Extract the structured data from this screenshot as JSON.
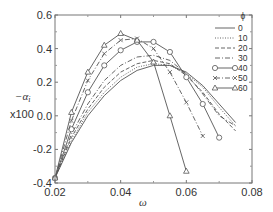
{
  "chart_data": {
    "type": "line",
    "title": "",
    "xlabel": "ω",
    "ylabel": "-α_i",
    "ylabel_scale": "x100",
    "xlim": [
      0.02,
      0.08
    ],
    "ylim": [
      -0.4,
      0.6
    ],
    "xticks": [
      "0.02",
      "0.04",
      "0.06",
      "0.08"
    ],
    "yticks": [
      "-0.4",
      "-0.2",
      "0.0",
      "0.2",
      "0.4",
      "0.6"
    ],
    "grid": false,
    "legend_title": "ϕ",
    "legend_position": "upper right",
    "series": [
      {
        "name": "0",
        "style": "solid",
        "marker": "none",
        "x": [
          0.02,
          0.025,
          0.03,
          0.035,
          0.04,
          0.045,
          0.05,
          0.055,
          0.06,
          0.065,
          0.07,
          0.075
        ],
        "y": [
          -0.37,
          -0.16,
          0.0,
          0.12,
          0.21,
          0.27,
          0.3,
          0.3,
          0.26,
          0.18,
          0.07,
          -0.04
        ]
      },
      {
        "name": "10",
        "style": "dotted",
        "marker": "none",
        "x": [
          0.02,
          0.025,
          0.03,
          0.035,
          0.04,
          0.045,
          0.05,
          0.055,
          0.06,
          0.065,
          0.07,
          0.075
        ],
        "y": [
          -0.37,
          -0.15,
          0.02,
          0.14,
          0.23,
          0.29,
          0.31,
          0.3,
          0.25,
          0.17,
          0.05,
          -0.06
        ]
      },
      {
        "name": "20",
        "style": "dashed",
        "marker": "none",
        "x": [
          0.02,
          0.025,
          0.03,
          0.035,
          0.04,
          0.045,
          0.05,
          0.055,
          0.06,
          0.065,
          0.07,
          0.075
        ],
        "y": [
          -0.37,
          -0.13,
          0.04,
          0.17,
          0.26,
          0.31,
          0.33,
          0.31,
          0.24,
          0.14,
          0.01,
          -0.09
        ]
      },
      {
        "name": "30",
        "style": "dashdot",
        "marker": "none",
        "x": [
          0.02,
          0.025,
          0.03,
          0.035,
          0.04,
          0.045,
          0.05,
          0.055,
          0.06,
          0.065,
          0.07,
          0.075
        ],
        "y": [
          -0.37,
          -0.11,
          0.07,
          0.21,
          0.3,
          0.35,
          0.36,
          0.33,
          0.25,
          0.13,
          0.0,
          -0.06
        ]
      },
      {
        "name": "40",
        "style": "solid",
        "marker": "circle",
        "x": [
          0.02,
          0.025,
          0.03,
          0.035,
          0.04,
          0.045,
          0.05,
          0.055,
          0.06,
          0.065,
          0.07
        ],
        "y": [
          -0.37,
          -0.08,
          0.14,
          0.3,
          0.39,
          0.44,
          0.44,
          0.38,
          0.23,
          0.07,
          -0.13
        ]
      },
      {
        "name": "50",
        "style": "dashdot",
        "marker": "x",
        "x": [
          0.02,
          0.025,
          0.03,
          0.035,
          0.04,
          0.045,
          0.05,
          0.055,
          0.06,
          0.065
        ],
        "y": [
          -0.37,
          -0.03,
          0.21,
          0.37,
          0.45,
          0.46,
          0.4,
          0.26,
          0.08,
          -0.12
        ]
      },
      {
        "name": "60",
        "style": "solid",
        "marker": "triangle",
        "x": [
          0.02,
          0.025,
          0.03,
          0.035,
          0.04,
          0.045,
          0.05,
          0.055,
          0.06
        ],
        "y": [
          -0.37,
          0.02,
          0.26,
          0.42,
          0.49,
          0.45,
          0.32,
          0.0,
          -0.33
        ]
      }
    ]
  },
  "axes": {
    "xlabel": "ω",
    "ylabel": "−α",
    "ylabel_sub": "i",
    "ylabel_scale": "x100"
  },
  "legend": {
    "title": "ϕ",
    "entries": [
      "0",
      "10",
      "20",
      "30",
      "40",
      "50",
      "60"
    ]
  }
}
